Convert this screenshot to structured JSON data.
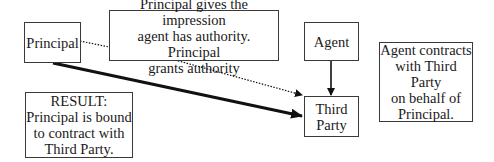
{
  "diagram": {
    "nodes": {
      "principal": {
        "label": "Principal"
      },
      "impression": {
        "label": "Principal gives the impression\nagent has authority. Principal\ngrants authority"
      },
      "agent": {
        "label": "Agent"
      },
      "third_party": {
        "label": "Third\nParty"
      },
      "agent_contracts": {
        "label": "Agent contracts\nwith Third Party\non behalf of\nPrincipal."
      },
      "result": {
        "label": "RESULT:\nPrincipal is bound\nto contract with\nThird Party."
      }
    },
    "edges": [
      {
        "from": "principal",
        "to": "impression",
        "style": "dotted"
      },
      {
        "from": "impression",
        "to": "third_party",
        "style": "dotted",
        "arrow": true
      },
      {
        "from": "agent",
        "to": "third_party",
        "style": "solid",
        "arrow": true
      },
      {
        "from": "principal",
        "to": "third_party",
        "style": "thick",
        "arrow": true
      }
    ],
    "colors": {
      "line": "#111111",
      "border": "#3a3a3a",
      "background": "#ffffff"
    }
  }
}
